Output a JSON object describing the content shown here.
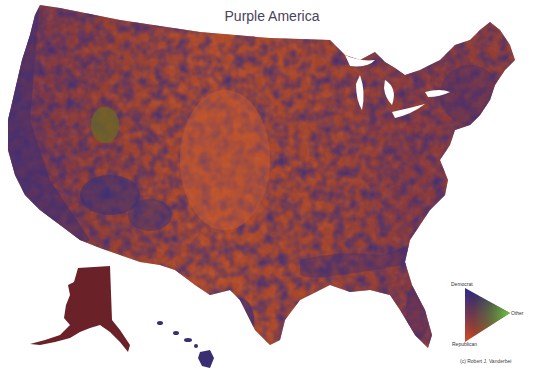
{
  "title": "Purple America",
  "legend": {
    "top_label": "Democrat",
    "right_label": "Other",
    "bottom_label": "Republican",
    "colors": {
      "democrat": "#2a2a8a",
      "other": "#5ec83a",
      "republican": "#d04a20"
    }
  },
  "credit": "(c) Robert J. Vanderbei",
  "map": {
    "regions": [
      "Continental United States",
      "Alaska",
      "Hawaii"
    ],
    "base_color": "#8a3a2a",
    "colors": {
      "dem_blue": "#3a2e78",
      "rep_orange": "#c65a30",
      "mixed_purple": "#6a2e4a",
      "alaska": "#6a2228",
      "utah_green": "#6a6a2a"
    }
  }
}
